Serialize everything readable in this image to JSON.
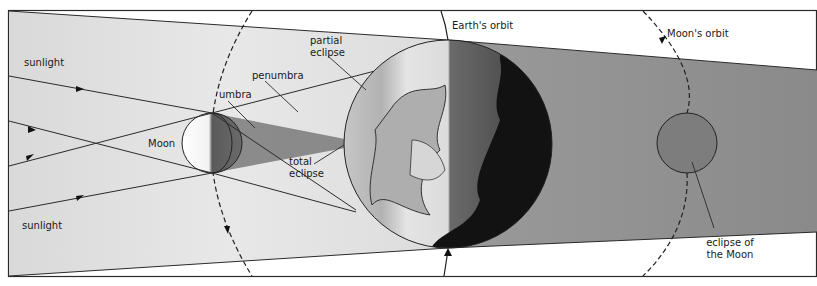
{
  "labels": {
    "sunlight_top": "sunlight",
    "sunlight_bottom": "sunlight",
    "moon": "Moon",
    "umbra": "umbra",
    "penumbra": "penumbra",
    "partial_eclipse_line1": "partial",
    "partial_eclipse_line2": "eclipse",
    "total_eclipse_line1": "total",
    "total_eclipse_line2": "eclipse",
    "earths_orbit": "Earth's orbit",
    "moons_orbit": "Moon's orbit",
    "eclipse_of_moon_line1": "eclipse of",
    "eclipse_of_moon_line2": "the Moon"
  },
  "colors": {
    "sunlight_region": "#e4e4e4",
    "umbra_cone": "#7a7a7a",
    "earth_shadow": "#8e8e8e",
    "earth_dark": "#111111",
    "eclipsed_moon": "#7d7d7d",
    "line": "#2a2a2a"
  }
}
